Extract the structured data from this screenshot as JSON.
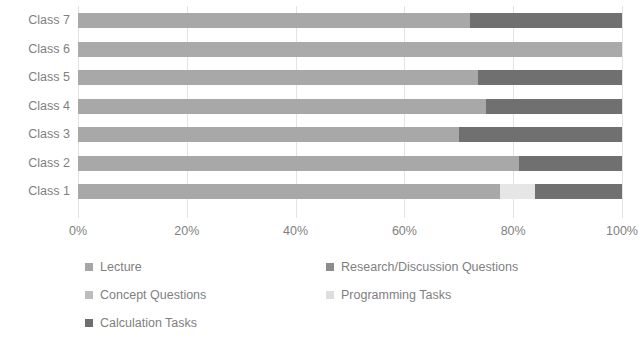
{
  "chart_data": {
    "type": "bar",
    "orientation": "horizontal",
    "stacked": true,
    "normalized": true,
    "title": "",
    "xlabel": "",
    "ylabel": "",
    "xlim": [
      0,
      100
    ],
    "xticks": [
      "0%",
      "20%",
      "40%",
      "60%",
      "80%",
      "100%"
    ],
    "xtick_values": [
      0,
      20,
      40,
      60,
      80,
      100
    ],
    "grid": true,
    "grid_axis": "x",
    "legend_position": "bottom",
    "categories": [
      "Class 1",
      "Class 2",
      "Class 3",
      "Class 4",
      "Class 5",
      "Class 6",
      "Class 7"
    ],
    "category_order_top_to_bottom": [
      "Class 7",
      "Class 6",
      "Class 5",
      "Class 4",
      "Class 3",
      "Class 2",
      "Class 1"
    ],
    "series": [
      {
        "name": "Lecture",
        "color": "#a6a6a6",
        "values": [
          77.5,
          81,
          70,
          75,
          73.5,
          100,
          72
        ]
      },
      {
        "name": "Research/Discussion Questions",
        "color": "#808080",
        "values": [
          0,
          0,
          0,
          0,
          0,
          0,
          0
        ]
      },
      {
        "name": "Concept Questions",
        "color": "#bfbfbf",
        "values": [
          0,
          0,
          0,
          0,
          0,
          0,
          0
        ]
      },
      {
        "name": "Programming Tasks",
        "color": "#e8e8e8",
        "values": [
          6.5,
          0,
          0,
          0,
          0,
          0,
          0
        ]
      },
      {
        "name": "Calculation Tasks",
        "color": "#6e6e6e",
        "values": [
          16,
          19,
          30,
          25,
          26.5,
          0,
          28
        ]
      }
    ],
    "rows": [
      {
        "label": "Class 7",
        "segments": [
          {
            "series": "Lecture",
            "value": 72,
            "color": "#a8a8a8"
          },
          {
            "series": "Calculation Tasks",
            "value": 28,
            "color": "#707070"
          }
        ]
      },
      {
        "label": "Class 6",
        "segments": [
          {
            "series": "Lecture",
            "value": 100,
            "color": "#aaaaaa"
          }
        ]
      },
      {
        "label": "Class 5",
        "segments": [
          {
            "series": "Lecture",
            "value": 73.5,
            "color": "#a8a8a8"
          },
          {
            "series": "Calculation Tasks",
            "value": 26.5,
            "color": "#707070"
          }
        ]
      },
      {
        "label": "Class 4",
        "segments": [
          {
            "series": "Lecture",
            "value": 75,
            "color": "#a8a8a8"
          },
          {
            "series": "Calculation Tasks",
            "value": 25,
            "color": "#707070"
          }
        ]
      },
      {
        "label": "Class 3",
        "segments": [
          {
            "series": "Lecture",
            "value": 70,
            "color": "#a8a8a8"
          },
          {
            "series": "Calculation Tasks",
            "value": 30,
            "color": "#707070"
          }
        ]
      },
      {
        "label": "Class 2",
        "segments": [
          {
            "series": "Lecture",
            "value": 81,
            "color": "#a8a8a8"
          },
          {
            "series": "Calculation Tasks",
            "value": 19,
            "color": "#707070"
          }
        ]
      },
      {
        "label": "Class 1",
        "segments": [
          {
            "series": "Lecture",
            "value": 77.5,
            "color": "#a8a8a8"
          },
          {
            "series": "Programming Tasks",
            "value": 6.5,
            "color": "#e6e6e6"
          },
          {
            "series": "Calculation Tasks",
            "value": 16,
            "color": "#707070"
          }
        ]
      }
    ],
    "legend": [
      {
        "label": "Lecture",
        "color": "#a6a6a6"
      },
      {
        "label": "Research/Discussion Questions",
        "color": "#8c8c8c"
      },
      {
        "label": "Concept Questions",
        "color": "#bdbdbd"
      },
      {
        "label": "Programming Tasks",
        "color": "#dedede"
      },
      {
        "label": "Calculation Tasks",
        "color": "#6e6e6e"
      }
    ]
  }
}
